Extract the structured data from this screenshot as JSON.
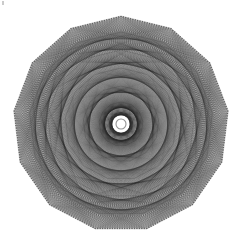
{
  "canvas": {
    "width": 241,
    "height": 240,
    "background_color": "#ffffff",
    "title": "Polygonal String-Art Rosette"
  },
  "artwork": {
    "name": "string-art-mandala",
    "description": "Dense chord-drawing rosette inscribed in a regular polygon",
    "ink_color": "#2a2a2a",
    "line_width": 0.32,
    "line_opacity": 0.5
  },
  "chart_data": {
    "type": "scatter",
    "xlabel": "",
    "ylabel": "",
    "grid": false,
    "legend": false,
    "center_x": 121,
    "center_y": 124,
    "polygon_sides": 13,
    "polygon_radius": 108,
    "polygon_rotation_deg": -90,
    "perimeter_points": 273,
    "points_per_side": 21,
    "chord_steps": [
      55,
      68,
      84,
      97,
      110,
      123,
      129
    ],
    "radial_spokes": 273,
    "spoke_inner_radius": 9,
    "spoke_outer_radius": 108,
    "core_hole_radius": 7,
    "core_ring_radius": 11,
    "inner_ring_radii": [
      22,
      38,
      56,
      74,
      92
    ],
    "vertices_polar_deg": [
      -90,
      -62.3,
      -34.6,
      -6.9,
      20.8,
      48.5,
      76.2,
      103.8,
      131.5,
      159.2,
      186.9,
      214.6,
      242.3
    ],
    "bounds": {
      "x_min": 13,
      "x_max": 229,
      "y_min": 16,
      "y_max": 233
    }
  },
  "artifacts": {
    "speck": {
      "name": "scan-speck",
      "x": 2,
      "y": 1,
      "color": "#b9b9b9"
    }
  }
}
